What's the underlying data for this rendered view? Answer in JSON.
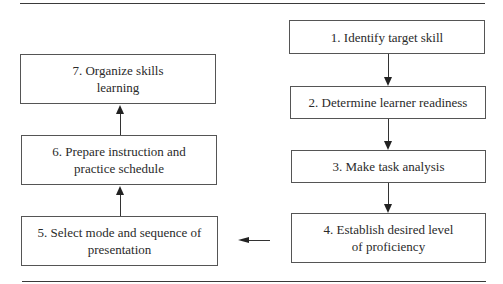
{
  "diagram": {
    "type": "flowchart",
    "steps": [
      {
        "id": 1,
        "label": "1. Identify target skill"
      },
      {
        "id": 2,
        "label": "2. Determine learner readiness"
      },
      {
        "id": 3,
        "label": "3. Make task analysis"
      },
      {
        "id": 4,
        "label": "4. Establish desired level of proficiency"
      },
      {
        "id": 5,
        "label": "5. Select mode and sequence of presentation"
      },
      {
        "id": 6,
        "label": "6. Prepare instruction and practice schedule"
      },
      {
        "id": 7,
        "label": "7. Organize skills learning"
      }
    ],
    "edges": [
      {
        "from": 1,
        "to": 2,
        "direction": "down"
      },
      {
        "from": 2,
        "to": 3,
        "direction": "down"
      },
      {
        "from": 3,
        "to": 4,
        "direction": "down"
      },
      {
        "from": 4,
        "to": 5,
        "direction": "left"
      },
      {
        "from": 5,
        "to": 6,
        "direction": "up"
      },
      {
        "from": 6,
        "to": 7,
        "direction": "up"
      }
    ]
  }
}
